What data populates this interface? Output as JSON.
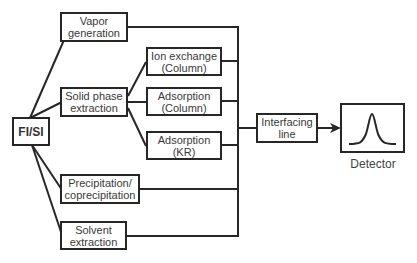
{
  "diagram": {
    "root": "FI/SI",
    "nodes": {
      "vapor_generation": "Vapor\ngeneration",
      "solid_phase_extraction": "Solid phase\nextraction",
      "ion_exchange_column": "Ion exchange\n(Column)",
      "adsorption_column": "Adsorption\n(Column)",
      "adsorption_kr": "Adsorption\n(KR)",
      "precipitation": "Precipitation/\ncoprecipitation",
      "solvent_extraction": "Solvent\nextraction",
      "interfacing_line": "Interfacing\nline",
      "detector_label": "Detector"
    },
    "colors": {
      "line": "#262626",
      "text": "#3a3a3a",
      "background": "#ffffff"
    }
  }
}
